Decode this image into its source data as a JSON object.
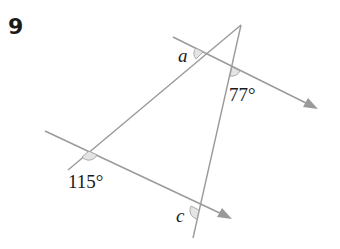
{
  "question": {
    "number": "9"
  },
  "diagram": {
    "line_color": "#9a9a9a",
    "arc_fill": "#e4e4e4",
    "labels": {
      "a": "a",
      "angle_77": "77°",
      "angle_115": "115°",
      "c": "c"
    },
    "angles": [
      {
        "name": "a",
        "value": "unknown"
      },
      {
        "name": "77°",
        "value": 77
      },
      {
        "name": "115°",
        "value": 115
      },
      {
        "name": "c",
        "value": "unknown"
      }
    ],
    "parallel_lines": 2,
    "transversals": 2
  }
}
